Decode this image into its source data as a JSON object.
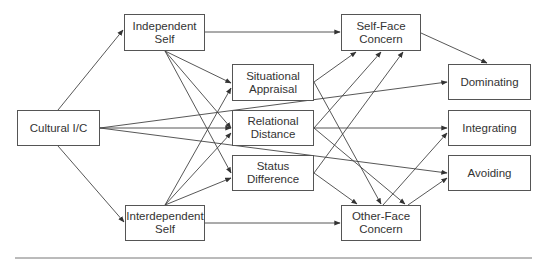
{
  "diagram": {
    "type": "path-model",
    "nodes": [
      {
        "id": "cultural",
        "line1": "Cultural I/C",
        "line2": ""
      },
      {
        "id": "independent",
        "line1": "Independent",
        "line2": "Self"
      },
      {
        "id": "interdependent",
        "line1": "Interdependent",
        "line2": "Self"
      },
      {
        "id": "situational",
        "line1": "Situational",
        "line2": "Appraisal"
      },
      {
        "id": "relational",
        "line1": "Relational",
        "line2": "Distance"
      },
      {
        "id": "status",
        "line1": "Status",
        "line2": "Difference"
      },
      {
        "id": "selfface",
        "line1": "Self-Face",
        "line2": "Concern"
      },
      {
        "id": "otherface",
        "line1": "Other-Face",
        "line2": "Concern"
      },
      {
        "id": "dominating",
        "line1": "Dominating",
        "line2": ""
      },
      {
        "id": "integrating",
        "line1": "Integrating",
        "line2": ""
      },
      {
        "id": "avoiding",
        "line1": "Avoiding",
        "line2": ""
      }
    ],
    "edges": [
      {
        "from": "Cultural I/C",
        "to": "Independent Self"
      },
      {
        "from": "Cultural I/C",
        "to": "Interdependent Self"
      },
      {
        "from": "Cultural I/C",
        "to": "Relational Distance"
      },
      {
        "from": "Cultural I/C",
        "to": "Dominating"
      },
      {
        "from": "Cultural I/C",
        "to": "Avoiding"
      },
      {
        "from": "Independent Self",
        "to": "Self-Face Concern"
      },
      {
        "from": "Independent Self",
        "to": "Situational Appraisal"
      },
      {
        "from": "Independent Self",
        "to": "Relational Distance"
      },
      {
        "from": "Independent Self",
        "to": "Status Difference"
      },
      {
        "from": "Interdependent Self",
        "to": "Other-Face Concern"
      },
      {
        "from": "Interdependent Self",
        "to": "Situational Appraisal"
      },
      {
        "from": "Interdependent Self",
        "to": "Relational Distance"
      },
      {
        "from": "Interdependent Self",
        "to": "Status Difference"
      },
      {
        "from": "Situational Appraisal",
        "to": "Self-Face Concern"
      },
      {
        "from": "Situational Appraisal",
        "to": "Other-Face Concern"
      },
      {
        "from": "Relational Distance",
        "to": "Self-Face Concern"
      },
      {
        "from": "Relational Distance",
        "to": "Other-Face Concern"
      },
      {
        "from": "Relational Distance",
        "to": "Integrating"
      },
      {
        "from": "Status Difference",
        "to": "Self-Face Concern"
      },
      {
        "from": "Status Difference",
        "to": "Other-Face Concern"
      },
      {
        "from": "Self-Face Concern",
        "to": "Dominating"
      },
      {
        "from": "Other-Face Concern",
        "to": "Integrating"
      },
      {
        "from": "Other-Face Concern",
        "to": "Avoiding"
      }
    ]
  }
}
